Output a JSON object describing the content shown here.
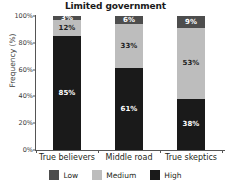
{
  "chart_data": {
    "type": "bar",
    "stacked": true,
    "title": "Limited government",
    "xlabel": "",
    "ylabel": "Frequency (%)",
    "ylim": [
      0,
      100
    ],
    "yticks": [
      "0%",
      "20%",
      "40%",
      "60%",
      "80%",
      "100%"
    ],
    "ytick_values": [
      0,
      20,
      40,
      60,
      80,
      100
    ],
    "grid": false,
    "legend_position": "bottom",
    "categories": [
      "True believers",
      "Middle road",
      "True skeptics"
    ],
    "series": [
      {
        "name": "High",
        "color": "#1a1a1a",
        "values": [
          85,
          61,
          38
        ],
        "labels": [
          "85%",
          "61%",
          "38%"
        ]
      },
      {
        "name": "Medium",
        "color": "#bdbdbd",
        "values": [
          12,
          33,
          53
        ],
        "labels": [
          "12%",
          "33%",
          "53%"
        ]
      },
      {
        "name": "Low",
        "color": "#4d4d4d",
        "values": [
          3,
          6,
          9
        ],
        "labels": [
          "3%",
          "6%",
          "9%"
        ]
      }
    ]
  },
  "legend": {
    "items": [
      {
        "label": "Low",
        "swatch": "low"
      },
      {
        "label": "Medium",
        "swatch": "medium"
      },
      {
        "label": "High",
        "swatch": "high"
      }
    ]
  }
}
